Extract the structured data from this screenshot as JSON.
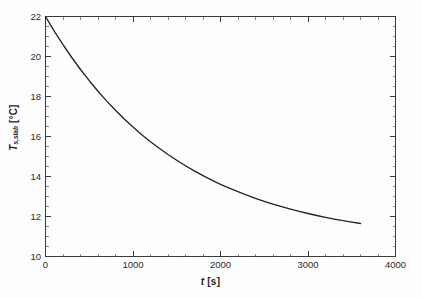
{
  "figure": {
    "background_color": "#fdfdfd",
    "frame_color": "#3a3a3a",
    "curve_color": "#242424"
  },
  "axes": {
    "x_title_var": "t",
    "x_title_unit": "[s]",
    "y_title_var": "T",
    "y_title_subscript": "s,slab",
    "y_title_unit": "[°C]",
    "x_ticks": [
      "0",
      "1000",
      "2000",
      "3000",
      "4000"
    ],
    "y_ticks": [
      "10",
      "12",
      "14",
      "16",
      "18",
      "20",
      "22"
    ]
  },
  "chart_data": {
    "type": "line",
    "title": "",
    "subtitle": "",
    "xlabel": "t [s]",
    "ylabel": "T_s,slab [°C]",
    "xlim": [
      0,
      4000
    ],
    "ylim": [
      10,
      22
    ],
    "x_major_tick_step": 1000,
    "x_minor_tick_step": 200,
    "y_major_tick_step": 2,
    "y_minor_tick_step": 0.5,
    "grid": false,
    "legend": null,
    "legend_position": "none",
    "annotations": [],
    "series": [
      {
        "name": "T_s,slab",
        "color": "#242424",
        "style": "solid",
        "x": [
          0,
          100,
          200,
          300,
          400,
          500,
          600,
          700,
          800,
          900,
          1000,
          1100,
          1200,
          1300,
          1400,
          1500,
          1600,
          1700,
          1800,
          1900,
          2000,
          2100,
          2200,
          2300,
          2400,
          2500,
          2600,
          2700,
          2800,
          2900,
          3000,
          3100,
          3200,
          3300,
          3400,
          3500,
          3600
        ],
        "y": [
          22.0,
          21.27,
          20.59,
          19.95,
          19.35,
          18.79,
          18.26,
          17.77,
          17.31,
          16.88,
          16.47,
          16.09,
          15.74,
          15.41,
          15.1,
          14.81,
          14.54,
          14.28,
          14.04,
          13.82,
          13.61,
          13.42,
          13.24,
          13.07,
          12.91,
          12.76,
          12.62,
          12.49,
          12.37,
          12.26,
          12.15,
          12.05,
          11.96,
          11.87,
          11.79,
          11.72,
          11.65
        ]
      }
    ]
  }
}
